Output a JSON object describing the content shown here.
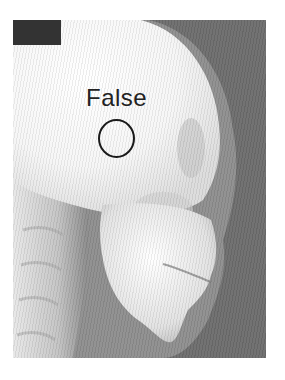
{
  "image": {
    "subject": "lateral skull x-ray (cephalogram)",
    "bounds": {
      "x": 13,
      "y": 20,
      "width": 253,
      "height": 338
    }
  },
  "annotation": {
    "label": "False",
    "circle": {
      "cx": 116,
      "cy": 138,
      "r": 19
    }
  },
  "marker": {
    "color": "#333333"
  },
  "colors": {
    "background": "#6e6e6e",
    "bone": "#f4f4f4",
    "soft_tissue": "#9a9a9a",
    "annotation": "#1a1a1a"
  }
}
